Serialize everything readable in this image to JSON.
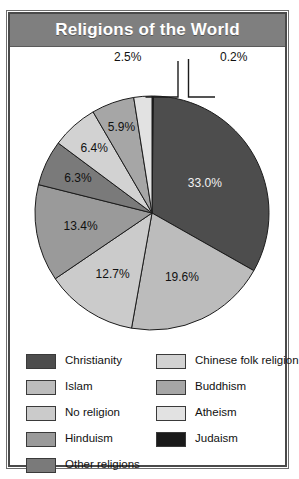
{
  "title": "Religions of the World",
  "chart_data": {
    "type": "pie",
    "title": "Religions of the World",
    "xlabel": "",
    "ylabel": "",
    "legend_position": "bottom",
    "grid": false,
    "start_angle_deg": 0,
    "direction": "clockwise",
    "categories": [
      "Judaism",
      "Christianity",
      "Islam",
      "No religion",
      "Hinduism",
      "Other religions",
      "Chinese folk religion",
      "Buddhism",
      "Atheism"
    ],
    "values": [
      0.2,
      33.0,
      19.6,
      12.7,
      13.4,
      6.3,
      6.4,
      5.9,
      2.5
    ],
    "labels": [
      "0.2%",
      "33.0%",
      "19.6%",
      "12.7%",
      "13.4%",
      "6.3%",
      "6.4%",
      "5.9%",
      "2.5%"
    ],
    "colors": [
      "#1a1a1a",
      "#4d4d4d",
      "#bcbcbc",
      "#cbcbcb",
      "#9a9a9a",
      "#7a7a7a",
      "#d2d2d2",
      "#a6a6a6",
      "#e2e2e2"
    ],
    "slices": [
      {
        "name": "Judaism",
        "value": 0.2,
        "label": "0.2%",
        "color": "#1a1a1a",
        "label_placement": "leader"
      },
      {
        "name": "Christianity",
        "value": 33.0,
        "label": "33.0%",
        "color": "#4d4d4d",
        "label_placement": "inside"
      },
      {
        "name": "Islam",
        "value": 19.6,
        "label": "19.6%",
        "color": "#bcbcbc",
        "label_placement": "inside"
      },
      {
        "name": "No religion",
        "value": 12.7,
        "label": "12.7%",
        "color": "#cbcbcb",
        "label_placement": "inside"
      },
      {
        "name": "Hinduism",
        "value": 13.4,
        "label": "13.4%",
        "color": "#9a9a9a",
        "label_placement": "inside"
      },
      {
        "name": "Other religions",
        "value": 6.3,
        "label": "6.3%",
        "color": "#7a7a7a",
        "label_placement": "inside"
      },
      {
        "name": "Chinese folk religion",
        "value": 6.4,
        "label": "6.4%",
        "color": "#d2d2d2",
        "label_placement": "inside"
      },
      {
        "name": "Buddhism",
        "value": 5.9,
        "label": "5.9%",
        "color": "#a6a6a6",
        "label_placement": "inside"
      },
      {
        "name": "Atheism",
        "value": 2.5,
        "label": "2.5%",
        "color": "#e2e2e2",
        "label_placement": "leader"
      }
    ]
  },
  "slice_labels": {
    "christianity": "33.0%",
    "islam": "19.6%",
    "no_religion": "12.7%",
    "hinduism": "13.4%",
    "other_religions": "6.3%",
    "chinese_folk_religion": "6.4%",
    "buddhism": "5.9%",
    "atheism": "2.5%",
    "judaism": "0.2%"
  },
  "legend": {
    "left_column": [
      {
        "label": "Christianity",
        "color": "#4d4d4d"
      },
      {
        "label": "Islam",
        "color": "#bcbcbc"
      },
      {
        "label": "No religion",
        "color": "#cbcbcb"
      },
      {
        "label": "Hinduism",
        "color": "#9a9a9a"
      },
      {
        "label": "Other religions",
        "color": "#7a7a7a"
      }
    ],
    "right_column": [
      {
        "label": "Chinese folk religion",
        "color": "#d2d2d2"
      },
      {
        "label": "Buddhism",
        "color": "#a6a6a6"
      },
      {
        "label": "Atheism",
        "color": "#e2e2e2"
      },
      {
        "label": "Judaism",
        "color": "#1a1a1a"
      }
    ]
  },
  "theme": {
    "title_bar_bg": "#7f7f7f",
    "title_text": "#ffffff",
    "frame_border": "#4a4a4a",
    "background": "#ffffff",
    "slice_outline": "#1c1c1c"
  }
}
